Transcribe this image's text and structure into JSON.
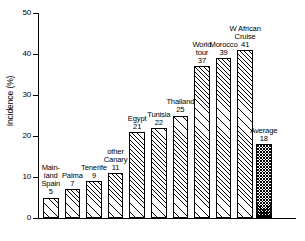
{
  "chart_data": {
    "type": "bar",
    "title": "",
    "xlabel": "",
    "ylabel": "Incidence (%)",
    "ylim": [
      0,
      50
    ],
    "yticks": [
      0,
      10,
      20,
      30,
      40,
      50
    ],
    "grid": false,
    "legend": "none",
    "categories": [
      "Mainland Spain",
      "Palma",
      "Tenerife",
      "other Canary",
      "Egypt",
      "Tunisia",
      "Thailand",
      "World tour",
      "Morocco",
      "W African Cruise",
      "Average"
    ],
    "values": [
      5,
      7,
      9,
      11,
      21,
      22,
      25,
      37,
      39,
      41,
      18
    ],
    "bars": [
      {
        "label_lines": [
          "Main-",
          "land",
          "Spain"
        ],
        "value": 5,
        "style": "hatch"
      },
      {
        "label_lines": [
          "Palma"
        ],
        "value": 7,
        "style": "hatch"
      },
      {
        "label_lines": [
          "Tenerife"
        ],
        "value": 9,
        "style": "hatch"
      },
      {
        "label_lines": [
          "other",
          "Canary"
        ],
        "value": 11,
        "style": "hatch"
      },
      {
        "label_lines": [
          "Egypt"
        ],
        "value": 21,
        "style": "hatch"
      },
      {
        "label_lines": [
          "Tunisia"
        ],
        "value": 22,
        "style": "hatch"
      },
      {
        "label_lines": [
          "Thailand"
        ],
        "value": 25,
        "style": "hatch"
      },
      {
        "label_lines": [
          "World",
          "tour"
        ],
        "value": 37,
        "style": "hatch"
      },
      {
        "label_lines": [
          "Morocco"
        ],
        "value": 39,
        "style": "hatch"
      },
      {
        "label_lines": [
          "W African",
          "Cruise"
        ],
        "value": 41,
        "style": "hatch"
      },
      {
        "label_lines": [
          "Average"
        ],
        "value": 18,
        "style": "dark"
      }
    ],
    "colors": {
      "axis": "#000000",
      "bar_outline": "#000000",
      "bar_fill": "#ffffff",
      "average_fill": "#555555"
    }
  }
}
